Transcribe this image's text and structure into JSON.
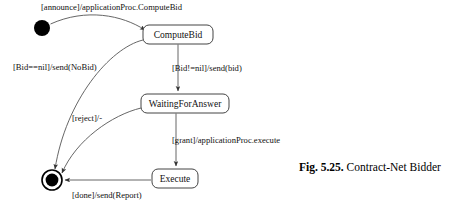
{
  "figure": {
    "number_label": "Fig. 5.25.",
    "caption_text": "Contract-Net Bidder"
  },
  "diagram": {
    "type": "uml-state-machine",
    "nodes": [
      {
        "id": "initial",
        "kind": "initial-state",
        "label": "",
        "cx": 42,
        "cy": 28,
        "r": 8
      },
      {
        "id": "computebid",
        "kind": "state",
        "label": "ComputeBid",
        "x": 143,
        "y": 25,
        "w": 70,
        "h": 19
      },
      {
        "id": "waitingforanswer",
        "kind": "state",
        "label": "WaitingForAnswer",
        "x": 141,
        "y": 94,
        "w": 88,
        "h": 19
      },
      {
        "id": "execute",
        "kind": "state",
        "label": "Execute",
        "x": 152,
        "y": 169,
        "w": 46,
        "h": 19
      },
      {
        "id": "final",
        "kind": "final-state",
        "label": "",
        "cx": 52,
        "cy": 180,
        "r_outer": 10,
        "r_inner": 6.4
      }
    ],
    "transitions": [
      {
        "id": "t1",
        "from": "initial",
        "to": "computebid",
        "label": "[announce]/applicationProc.ComputeBid",
        "label_x": 41,
        "label_y": 10
      },
      {
        "id": "t2",
        "from": "computebid",
        "to": "waitingforanswer",
        "label": "[Bid!=nil]/send(bid)",
        "label_x": 172,
        "label_y": 71
      },
      {
        "id": "t3",
        "from": "computebid",
        "to": "final",
        "label": "[Bid==nil]/send(NoBid)",
        "label_x": 13,
        "label_y": 70
      },
      {
        "id": "t4",
        "from": "waitingforanswer",
        "to": "final",
        "label": "[reject]/-",
        "label_x": 72,
        "label_y": 121
      },
      {
        "id": "t5",
        "from": "waitingforanswer",
        "to": "execute",
        "label": "[grant]/applicationProc.execute",
        "label_x": 172,
        "label_y": 143
      },
      {
        "id": "t6",
        "from": "execute",
        "to": "final",
        "label": "[done]/send(Report)",
        "label_x": 72,
        "label_y": 198
      }
    ],
    "colors": {
      "stroke": "#555555",
      "state_border": "#444444",
      "text": "#111111",
      "background": "#ffffff"
    }
  }
}
